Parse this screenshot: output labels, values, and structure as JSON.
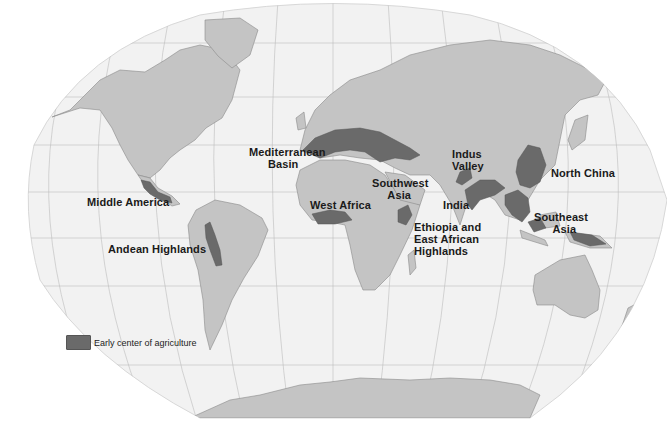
{
  "map": {
    "title": "Early centers of agriculture",
    "projection": "Robinson-like world projection",
    "colors": {
      "ocean": "#f2f2f2",
      "land": "#c4c4c4",
      "agriculture_center": "#6a6a6a",
      "graticule": "#b8b8b8",
      "background": "#ffffff"
    },
    "labels": [
      {
        "id": "middle-america",
        "text": "Middle America",
        "x": 87,
        "y": 202
      },
      {
        "id": "andean-highlands",
        "text": "Andean Highlands",
        "x": 108,
        "y": 248
      },
      {
        "id": "mediterranean-basin",
        "text": "Mediterranean\n      Basin",
        "x": 249,
        "y": 146
      },
      {
        "id": "southwest-asia",
        "text": "Southwest\n     Asia",
        "x": 372,
        "y": 178
      },
      {
        "id": "west-africa",
        "text": "West Africa",
        "x": 310,
        "y": 201
      },
      {
        "id": "indus-valley",
        "text": "Indus\nValley",
        "x": 454,
        "y": 149
      },
      {
        "id": "india",
        "text": "India",
        "x": 442,
        "y": 199
      },
      {
        "id": "ethiopia-east-african-highlands",
        "text": "Ethiopia and\nEast African\nHighlands",
        "x": 414,
        "y": 221
      },
      {
        "id": "north-china",
        "text": "North China",
        "x": 551,
        "y": 168
      },
      {
        "id": "southeast-asia",
        "text": "Southeast\n      Asia",
        "x": 534,
        "y": 211
      }
    ]
  },
  "legend": {
    "items": [
      {
        "label": "Early center of agriculture",
        "color": "#6a6a6a"
      }
    ]
  }
}
